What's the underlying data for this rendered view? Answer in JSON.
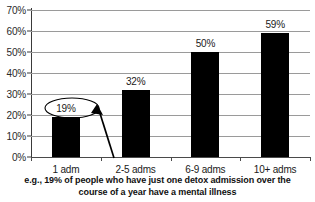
{
  "chart_data": {
    "type": "bar",
    "title": "",
    "xlabel": "",
    "ylabel": "",
    "categories": [
      "1 adm",
      "2-5 adms",
      "6-9 adms",
      "10+ adms"
    ],
    "values": [
      19,
      32,
      50,
      59
    ],
    "value_labels": [
      "19%",
      "32%",
      "50%",
      "59%"
    ],
    "ylim": [
      0,
      70
    ],
    "ytick_values": [
      0,
      10,
      20,
      30,
      40,
      50,
      60,
      70
    ],
    "ytick_labels": [
      "0%",
      "10%",
      "20%",
      "30%",
      "40%",
      "50%",
      "60%",
      "70%"
    ],
    "grid": true,
    "legend": "none",
    "bar_color": "#000000",
    "grid_color": "#9a9a9a",
    "axis_color": "#3a3a3a",
    "annotations": [
      {
        "type": "ellipse-highlight",
        "target_label": "19%",
        "target_category": "1 adm"
      },
      {
        "type": "arrow",
        "points_to": "19%"
      }
    ]
  },
  "caption": {
    "line1": "e.g., 19% of people who have just one detox admission over the",
    "line2": "course of a year have a mental illness"
  }
}
